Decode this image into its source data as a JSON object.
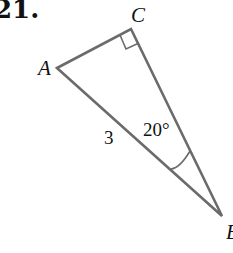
{
  "problem": {
    "number": "21."
  },
  "figure": {
    "type": "right-triangle",
    "vertices": {
      "A": {
        "label": "A",
        "x": 57,
        "y": 68
      },
      "C": {
        "label": "C",
        "x": 131,
        "y": 29
      },
      "B": {
        "label": "B",
        "x": 222,
        "y": 216
      }
    },
    "right_angle_at": "C",
    "side_labels": {
      "hypotenuse_AB": "3"
    },
    "angle_labels": {
      "B": "20°"
    },
    "colors": {
      "line": "#6b6b6b",
      "text": "#111111"
    }
  }
}
